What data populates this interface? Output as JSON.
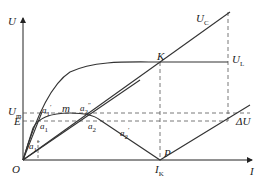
{
  "diagram": {
    "axes": {
      "y_label": "U",
      "x_label": "I",
      "origin_label": "O"
    },
    "curves": {
      "uc_label": "U",
      "uc_sub": "C",
      "ul_label": "U",
      "ul_sub": "L",
      "du_label": "ΔU"
    },
    "levels": {
      "um_label": "U",
      "um_sub": "m",
      "e_label": "E"
    },
    "points": {
      "k_label": "K",
      "p_label": "P",
      "ik_label": "I",
      "ik_sub": "K",
      "m_label": "m",
      "a1_prime": "a",
      "a1_prime_sub": "1",
      "a1_prime_sup": "′",
      "a1": "a",
      "a1_sub": "1",
      "a1_dblprime": "a",
      "a1_dblprime_sub": "1",
      "a1_dblprime_sup": "″",
      "a2_dblprime": "a",
      "a2_dblprime_sub": "2",
      "a2_dblprime_sup": "″",
      "a2": "a",
      "a2_sub": "2",
      "a2_prime": "a",
      "a2_prime_sub": "2",
      "a2_prime_sup": "′"
    },
    "colors": {
      "line": "#333333",
      "dash": "#555555"
    }
  }
}
